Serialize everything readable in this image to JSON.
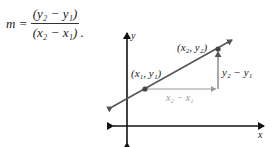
{
  "formula": {
    "lhs": "m",
    "equals": "=",
    "numerator": "(y₂ − y₁)",
    "denominator": "(x₂ − x₁)",
    "trailing": "."
  },
  "diagram": {
    "axis_x_label": "x",
    "axis_y_label": "y",
    "point1_label": "(x₁, y₁)",
    "point2_label": "(x₂, y₂)",
    "run_label": "x₂ − x₁",
    "rise_label": "y₂ − y₁",
    "colors": {
      "axis": "#111111",
      "line": "#555555",
      "run": "#9a9a9a",
      "point": "#444444"
    }
  }
}
